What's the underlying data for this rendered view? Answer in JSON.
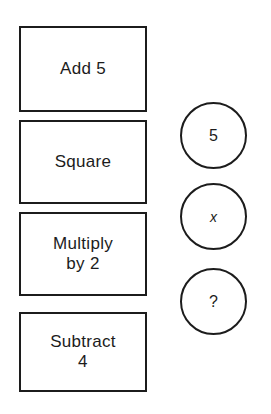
{
  "diagram": {
    "background_color": "#ffffff",
    "stroke_color": "#1c1c1c",
    "operation_boxes": [
      {
        "id": "add",
        "label": "Add 5",
        "shape": "rectangle"
      },
      {
        "id": "square",
        "label": "Square",
        "shape": "rectangle"
      },
      {
        "id": "multiply",
        "label": "Multiply\nby 2",
        "shape": "rectangle"
      },
      {
        "id": "subtract",
        "label": "Subtract\n4",
        "shape": "rectangle"
      }
    ],
    "value_circles": [
      {
        "id": "five",
        "label": "5",
        "shape": "circle",
        "style": "number"
      },
      {
        "id": "variable",
        "label": "x",
        "shape": "circle",
        "style": "italic-variable"
      },
      {
        "id": "unknown",
        "label": "?",
        "shape": "circle",
        "style": "question-mark"
      }
    ]
  }
}
